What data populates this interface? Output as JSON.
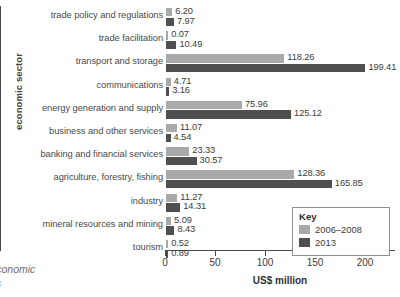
{
  "chart_data": {
    "type": "bar",
    "orientation": "horizontal",
    "title": "",
    "xlabel": "US$ million",
    "ylabel": "economic sector",
    "xlim": [
      0,
      230
    ],
    "xticks": [
      0,
      50,
      100,
      150,
      200
    ],
    "grid": false,
    "legend_position": "bottom-right",
    "legend_title": "Key",
    "categories": [
      "trade policy and regulations",
      "trade facilitation",
      "transport and storage",
      "communications",
      "energy generation and supply",
      "business and other services",
      "banking and financial services",
      "agriculture, forestry, fishing",
      "industry",
      "mineral resources and mining",
      "tourism"
    ],
    "series": [
      {
        "name": "2006–2008",
        "color": "#a9a9a9",
        "values": [
          6.2,
          0.07,
          118.26,
          4.71,
          75.96,
          11.07,
          23.33,
          128.36,
          11.27,
          5.09,
          0.52
        ],
        "labels": [
          "6.20",
          "0.07",
          "118.26",
          "4.71",
          "75.96",
          "11.07",
          "23.33",
          "128.36",
          "11.27",
          "5.09",
          "0.52"
        ]
      },
      {
        "name": "2013",
        "color": "#4f4f4f",
        "values": [
          7.97,
          10.49,
          199.41,
          3.16,
          125.12,
          4.54,
          30.57,
          165.85,
          14.31,
          8.43,
          0.89
        ],
        "labels": [
          "7.97",
          "10.49",
          "199.41",
          "3.16",
          "125.12",
          "4.54",
          "30.57",
          "165.85",
          "14.31",
          "8.43",
          "0.89"
        ]
      }
    ]
  },
  "axes": {
    "y_title": "economic sector",
    "x_title": "US$ million",
    "x_tick_labels": [
      "0",
      "50",
      "100",
      "150",
      "200"
    ]
  },
  "legend": {
    "title": "Key",
    "entries": [
      {
        "label": "2006–2008",
        "color": "#a9a9a9"
      },
      {
        "label": "2013",
        "color": "#4f4f4f"
      }
    ]
  },
  "caption": {
    "line1": "r economic",
    "line2": "nds"
  }
}
